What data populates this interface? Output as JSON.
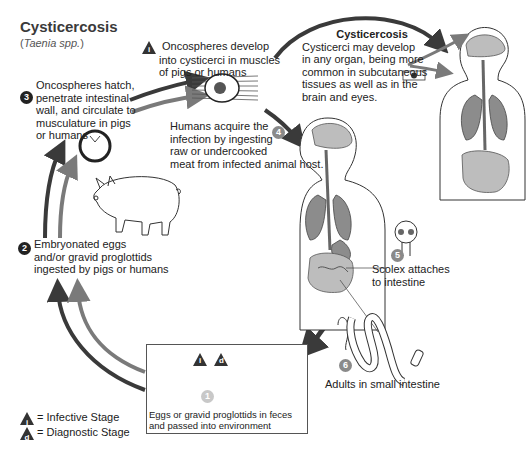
{
  "header": {
    "title": "Cysticercosis",
    "subtitle": "Taenia spp."
  },
  "stages": [
    {
      "number": "1",
      "text_line1": "Eggs or gravid proglottids in feces",
      "text_line2": "and passed into environment",
      "markers": [
        "i",
        "d"
      ]
    },
    {
      "number": "2",
      "text_line1": "Embryonated eggs",
      "text_line2": "and/or gravid proglottids",
      "text_line3": "ingested by pigs or humans"
    },
    {
      "number": "3",
      "text_line1": "Oncospheres hatch,",
      "text_line2": "penetrate intestinal",
      "text_line3": "wall, and circulate to",
      "text_line4": "musculature in pigs",
      "text_line5": "or humans"
    },
    {
      "number": "4",
      "text_line1": "Humans acquire the",
      "text_line2": "infection by ingesting",
      "text_line3": "raw or undercooked",
      "text_line4": "meat from infected animal host."
    },
    {
      "number": "5",
      "text_line1": "Scolex attaches",
      "text_line2": "to intestine"
    },
    {
      "number": "6",
      "text_line1": "Adults in small intestine"
    }
  ],
  "infective_note": {
    "marker": "i",
    "text_line1": "Oncospheres develop",
    "text_line2": "into cysticerci in muscles",
    "text_line3": "of pigs or humans"
  },
  "cysticercosis_box": {
    "title": "Cysticercosis",
    "text_line1": "Cysticerci may develop",
    "text_line2": "in any organ, being more",
    "text_line3": "common in subcutaneous",
    "text_line4": "tissues as well as in the",
    "text_line5": "brain and eyes."
  },
  "legend": {
    "infective": {
      "marker": "i",
      "label": "= Infective Stage"
    },
    "diagnostic": {
      "marker": "d",
      "label": "= Diagnostic Stage"
    }
  },
  "colors": {
    "arrow_dark": "#3a3a3a",
    "arrow_gray": "#7a7a7a",
    "organ_gray": "#8c8c8c",
    "organ_light": "#bdbdbd",
    "text": "#1a1a1a"
  }
}
